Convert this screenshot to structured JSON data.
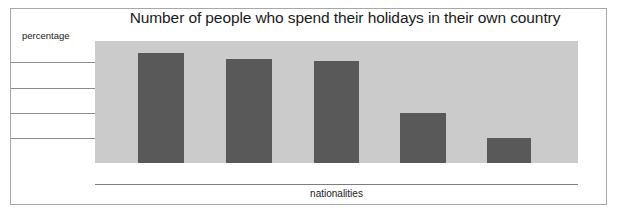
{
  "chart_data": {
    "type": "bar",
    "title": "Number of people who spend their holidays in their own country",
    "xlabel": "nationalities",
    "ylabel": "percentage",
    "categories": [
      "",
      "",
      "",
      "",
      ""
    ],
    "values": [
      90,
      85,
      83,
      40,
      20
    ],
    "ylim": [
      0,
      100
    ],
    "grid": true,
    "gridlines": [
      80,
      60,
      40,
      20
    ],
    "legend": "none",
    "bar_color": "#595959",
    "plot_background": "#cbcbcb",
    "gridline_color": "#8c8c8c",
    "axis_color": "#7d7d7d",
    "frame_color": "#a8a8a8",
    "text_color": "#1a1a1a",
    "tick_labels_x": [],
    "tick_labels_y": [],
    "annotations": []
  },
  "bars": [
    {
      "name": "bar-1",
      "left_px": 138,
      "width_px": 46,
      "top_px": 12
    },
    {
      "name": "bar-2",
      "left_px": 226,
      "width_px": 46,
      "top_px": 18
    },
    {
      "name": "bar-3",
      "left_px": 314,
      "width_px": 45,
      "top_px": 20
    },
    {
      "name": "bar-4",
      "left_px": 400,
      "width_px": 46,
      "top_px": 72
    },
    {
      "name": "bar-5",
      "left_px": 487,
      "width_px": 44,
      "top_px": 97
    }
  ],
  "gridlines": [
    {
      "name": "gridline-1",
      "top_px": 62
    },
    {
      "name": "gridline-2",
      "top_px": 88
    },
    {
      "name": "gridline-3",
      "top_px": 113
    },
    {
      "name": "gridline-4",
      "top_px": 138
    }
  ]
}
